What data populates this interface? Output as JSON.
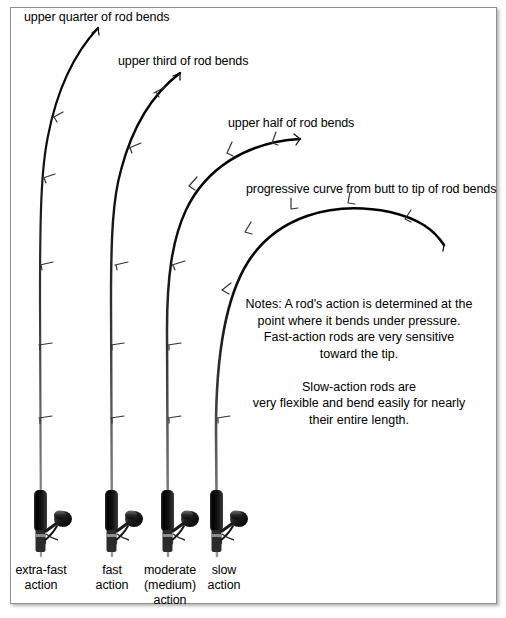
{
  "figure": {
    "background_color": "#ffffff",
    "border_color": "#8f8f8f",
    "ink_color": "#000000"
  },
  "callouts": [
    {
      "id": "callout-extra-fast",
      "text": "upper quarter of rod bends",
      "x": 24,
      "y": 10
    },
    {
      "id": "callout-fast",
      "text": "upper third of rod bends",
      "x": 118,
      "y": 54
    },
    {
      "id": "callout-moderate",
      "text": "upper half of rod bends",
      "x": 228,
      "y": 116
    },
    {
      "id": "callout-slow",
      "text": "progressive curve from butt to tip of rod bends",
      "x": 246,
      "y": 182
    }
  ],
  "notes": {
    "line1": "Notes:  A rod's action is determined at the",
    "line2": "point where it bends under pressure.",
    "line3": "Fast-action rods are very sensitive",
    "line4": "toward the tip.",
    "line5": "Slow-action rods are",
    "line6": "very flexible and bend easily for nearly",
    "line7": "their entire length.",
    "block": "Notes:  A rod's action is determined at the\npoint where it bends under pressure.\nFast-action rods are very sensitive\ntoward the tip.\n\nSlow-action rods are\nvery flexible and bend easily for nearly\ntheir entire length.",
    "x": 236,
    "y": 296,
    "width": 246
  },
  "rods": [
    {
      "id": "rod-extra-fast",
      "label": "extra-fast\naction",
      "label_line1": "extra-fast",
      "label_line2": "action",
      "label_x": 8,
      "label_y": 563,
      "label_width": 66,
      "butt_x": 41,
      "butt_y": 556,
      "tip_x": 98,
      "tip_y": 27,
      "bend_fraction": 0.25,
      "description": "Only the upper quarter of the blank flexes."
    },
    {
      "id": "rod-fast",
      "label": "fast\naction",
      "label_line1": "fast",
      "label_line2": "action",
      "label_x": 84,
      "label_y": 563,
      "label_width": 56,
      "butt_x": 112,
      "butt_y": 556,
      "tip_x": 180,
      "tip_y": 72,
      "bend_fraction": 0.33,
      "description": "The upper third of the blank flexes."
    },
    {
      "id": "rod-moderate",
      "label": "moderate\n(medium)\naction",
      "label_line1": "moderate",
      "label_line2": "(medium)",
      "label_line3": "action",
      "label_x": 136,
      "label_y": 563,
      "label_width": 68,
      "butt_x": 168,
      "butt_y": 556,
      "tip_x": 300,
      "tip_y": 138,
      "bend_fraction": 0.5,
      "description": "The upper half of the blank flexes."
    },
    {
      "id": "rod-slow",
      "label": "slow\naction",
      "label_line1": "slow",
      "label_line2": "action",
      "label_x": 196,
      "label_y": 563,
      "label_width": 56,
      "butt_x": 217,
      "butt_y": 556,
      "tip_x": 444,
      "tip_y": 244,
      "bend_fraction": 1.0,
      "description": "Progressive curve bends from butt to tip."
    }
  ],
  "parts": {
    "guide_name": "rod-guide",
    "tip_top_name": "rod-tip-top",
    "grip_name": "rod-grip",
    "reel_name": "spinning-reel",
    "reel_handle_name": "reel-handle",
    "reel_seat_name": "reel-seat",
    "blank_name": "rod-blank"
  }
}
